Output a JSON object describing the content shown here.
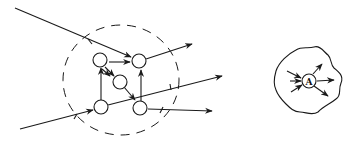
{
  "figure": {
    "left_panel": {
      "description": "particles interacting within dashed region",
      "node_count": 5,
      "boundary_style": "dashed"
    },
    "right_panel": {
      "description": "particle A within irregular region",
      "node_label": "A"
    }
  },
  "colors": {
    "stroke": "#1a1a1a",
    "background": "#ffffff"
  }
}
